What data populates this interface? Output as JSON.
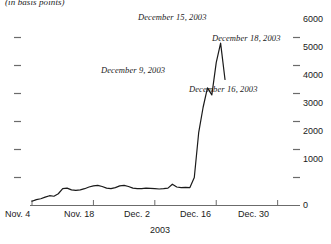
{
  "chart_data": {
    "type": "line",
    "title": "",
    "subtitle": "(in basis points)",
    "xlabel": "2003",
    "ylabel": "",
    "ylim": [
      0,
      6400
    ],
    "xlim": [
      0,
      60
    ],
    "grid": false,
    "legend": null,
    "y_ticks": [
      0,
      1000,
      2000,
      3000,
      4000,
      5000,
      6000
    ],
    "y_tick_labels": [
      "0",
      "1000",
      "2000",
      "3000",
      "4000",
      "5000",
      "6000"
    ],
    "y_axis_position": "right",
    "left_tick_count": 6,
    "x_ticks": [
      0,
      14,
      28,
      42,
      56
    ],
    "x_tick_labels": [
      "Nov. 4",
      "Nov. 18",
      "Dec. 2",
      "Dec. 16",
      "Dec. 30"
    ],
    "series": [
      {
        "name": "spread",
        "units": "basis points",
        "x": [
          0,
          1,
          2,
          3,
          4,
          5,
          6,
          7,
          8,
          9,
          10,
          11,
          12,
          13,
          14,
          15,
          16,
          17,
          18,
          19,
          20,
          21,
          22,
          23,
          24,
          25,
          26,
          27,
          28,
          29,
          30,
          31,
          32,
          33,
          34,
          35,
          36,
          37,
          38,
          39,
          40,
          41,
          42,
          43,
          44
        ],
        "values": [
          150,
          210,
          240,
          300,
          350,
          330,
          420,
          600,
          620,
          560,
          540,
          560,
          600,
          660,
          700,
          720,
          680,
          620,
          600,
          640,
          700,
          720,
          680,
          620,
          600,
          600,
          620,
          610,
          600,
          590,
          600,
          620,
          760,
          660,
          640,
          650,
          640,
          1000,
          2600,
          3500,
          4200,
          3950,
          5100,
          5800,
          4500
        ]
      }
    ],
    "annotations": [
      {
        "text": "December 9, 2003",
        "x_index": 35,
        "y_value": 4500
      },
      {
        "text": "December 15, 2003",
        "x_index": 41,
        "y_value": 6200
      },
      {
        "text": "December 16, 2003",
        "x_index": 43,
        "y_value": 4050
      },
      {
        "text": "December 18, 2003",
        "x_index": 46,
        "y_value": 5400
      }
    ]
  },
  "axis": {
    "y_labels": [
      "6000",
      "5000",
      "4000",
      "3000",
      "2000",
      "1000",
      "0"
    ],
    "x_labels": [
      "Nov. 4",
      "Nov. 18",
      "Dec. 2",
      "Dec. 16",
      "Dec. 30"
    ],
    "x_title": "2003"
  },
  "header": {
    "subtitle": "(in basis points)"
  },
  "annotations": {
    "dec9": "December 9, 2003",
    "dec15": "December 15, 2003",
    "dec16": "December 16, 2003",
    "dec18": "December 18, 2003"
  },
  "colors": {
    "line": "#1a1a1a",
    "axis": "#6b6b6b",
    "text": "#1a1a1a",
    "background": "#ffffff"
  }
}
